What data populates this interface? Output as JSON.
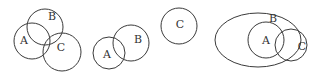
{
  "diagrams": [
    {
      "name": "three-overlapping-chain",
      "shapes": [
        {
          "label": "A",
          "cx": 32,
          "cy": 41,
          "rx": 18,
          "ry": 18,
          "lx": 24,
          "ly": 41
        },
        {
          "label": "B",
          "cx": 45,
          "cy": 27,
          "rx": 18,
          "ry": 18,
          "lx": 52,
          "ly": 17
        },
        {
          "label": "C",
          "cx": 62,
          "cy": 52,
          "rx": 19,
          "ry": 19,
          "lx": 61,
          "ly": 48
        }
      ]
    },
    {
      "name": "two-overlapping-one-separate",
      "shapes": [
        {
          "label": "A",
          "cx": 109,
          "cy": 53,
          "rx": 16,
          "ry": 16,
          "lx": 107,
          "ly": 55
        },
        {
          "label": "B",
          "cx": 131,
          "cy": 43,
          "rx": 18,
          "ry": 18,
          "lx": 138,
          "ly": 40
        },
        {
          "label": "C",
          "cx": 179,
          "cy": 26,
          "rx": 18,
          "ry": 18,
          "lx": 180,
          "ly": 25
        }
      ]
    },
    {
      "name": "a-inside-b-c-overlapping",
      "shapes": [
        {
          "label": "B",
          "cx": 258,
          "cy": 40,
          "rx": 43,
          "ry": 27,
          "lx": 273,
          "ly": 19
        },
        {
          "label": "A",
          "cx": 266,
          "cy": 40,
          "rx": 18,
          "ry": 18,
          "lx": 266,
          "ly": 41
        },
        {
          "label": "C",
          "cx": 291,
          "cy": 45,
          "rx": 16,
          "ry": 16,
          "lx": 302,
          "ly": 47
        }
      ]
    }
  ],
  "colors": {
    "stroke": "#3a3a3a",
    "text": "#333333",
    "background": "#ffffff"
  }
}
